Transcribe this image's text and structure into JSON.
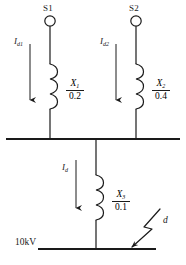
{
  "diagram": {
    "system_voltage": "10kV",
    "sources": [
      {
        "id": "S1",
        "label": "S1"
      },
      {
        "id": "S2",
        "label": "S2"
      }
    ],
    "currents": [
      {
        "id": "Id1",
        "symbol": "I",
        "subscript": "d1"
      },
      {
        "id": "Id2",
        "symbol": "I",
        "subscript": "d2"
      },
      {
        "id": "Id",
        "symbol": "I",
        "subscript": "d"
      }
    ],
    "reactances": [
      {
        "id": "X1",
        "symbol": "X",
        "subscript": "1",
        "value": "0.2"
      },
      {
        "id": "X2",
        "symbol": "X",
        "subscript": "2",
        "value": "0.4"
      },
      {
        "id": "X3",
        "symbol": "X",
        "subscript": "3",
        "value": "0.1"
      }
    ],
    "fault": {
      "label": "d",
      "type": "short-circuit-fault"
    },
    "busbars": [
      {
        "id": "main-bus",
        "name": "upper-busbar"
      },
      {
        "id": "lv-bus",
        "name": "lower-busbar",
        "voltage": "10kV"
      }
    ],
    "colors": {
      "line": "#1a1a1a",
      "text": "#1a1a1a",
      "background": "#ffffff"
    }
  }
}
